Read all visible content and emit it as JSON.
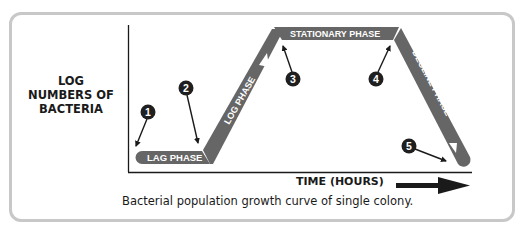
{
  "diagram": {
    "y_axis_label": "LOG NUMBERS OF BACTERIA",
    "y_axis_label_lines": [
      "LOG",
      "NUMBERS OF",
      "BACTERIA"
    ],
    "x_axis_label": "TIME (HOURS)",
    "caption": "Bacterial population growth curve of single colony.",
    "phases": [
      {
        "id": "lag",
        "label": "LAG PHASE"
      },
      {
        "id": "log",
        "label": "LOG PHASE"
      },
      {
        "id": "stationary",
        "label": "STATIONARY PHASE"
      },
      {
        "id": "decline",
        "label": "DECLINE PHASE"
      }
    ],
    "markers": [
      {
        "number": "1"
      },
      {
        "number": "2"
      },
      {
        "number": "3"
      },
      {
        "number": "4"
      },
      {
        "number": "5"
      }
    ],
    "colors": {
      "band": "#666666",
      "marker": "#1f1f1f",
      "axis": "#1a1a1a",
      "card_border": "#c8c8c8",
      "band_text": "#ffffff"
    }
  }
}
